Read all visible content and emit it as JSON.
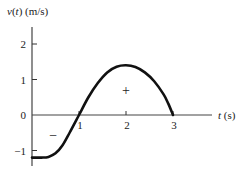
{
  "chart_data": {
    "type": "line",
    "title": "",
    "ylabel": "v(t) (m/s)",
    "ylabel_func": "v",
    "ylabel_arg": "t",
    "ylabel_units": "(m/s)",
    "xlabel": "t (s)",
    "xlabel_var": "t",
    "xlabel_units": "(s)",
    "xlim": [
      0,
      3.8
    ],
    "ylim": [
      -1.4,
      2.5
    ],
    "x_ticks": [
      1,
      2,
      3
    ],
    "y_ticks": [
      2,
      1,
      0,
      -1
    ],
    "x_tick_labels": [
      "1",
      "2",
      "3"
    ],
    "y_tick_labels": [
      "2",
      "1",
      "0",
      "−1"
    ],
    "grid": false,
    "series": [
      {
        "name": "v(t)",
        "x": [
          0,
          0.2,
          0.35,
          0.5,
          0.65,
          0.8,
          1.0,
          1.2,
          1.4,
          1.6,
          1.8,
          2.0,
          2.2,
          2.4,
          2.6,
          2.8,
          2.9,
          3.0
        ],
        "y": [
          -1.2,
          -1.2,
          -1.18,
          -1.08,
          -0.85,
          -0.5,
          0.0,
          0.5,
          0.9,
          1.2,
          1.36,
          1.4,
          1.35,
          1.2,
          0.95,
          0.58,
          0.32,
          0.0
        ]
      }
    ],
    "annotations": [
      {
        "text": "−",
        "x": 0.45,
        "y": -0.55,
        "meaning": "negative area"
      },
      {
        "text": "+",
        "x": 2.0,
        "y": 0.7,
        "meaning": "positive area"
      }
    ]
  }
}
